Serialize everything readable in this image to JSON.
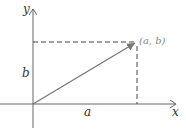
{
  "diagram": {
    "type": "vector-components",
    "axes": {
      "x_label": "x",
      "y_label": "y"
    },
    "vector": {
      "from": "origin",
      "to_label": "(a, b)"
    },
    "components": {
      "horizontal_label": "a",
      "vertical_label": "b"
    },
    "colors": {
      "axis": "#555555",
      "vector": "#777777",
      "dashed": "#444444",
      "text": "#333333",
      "point_label": "#888888"
    }
  }
}
